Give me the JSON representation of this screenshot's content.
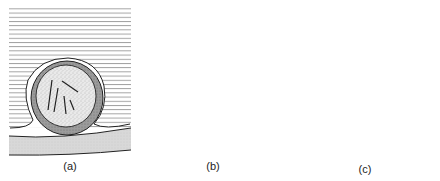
{
  "figure": {
    "panels": [
      {
        "id": "a",
        "label": "(a)",
        "description": "Particle enclosed by encapsulating film on substrate"
      },
      {
        "id": "b",
        "label": "(b)",
        "description": "Particle and substrate surrounded by adsorbed surfactant molecules"
      },
      {
        "id": "c",
        "label": "(c)",
        "description": "Porous solid with surfactant-lined crevices"
      }
    ]
  },
  "colors": {
    "line": "#222222",
    "stipple": "#9a9a9a",
    "substrate": "#d6d6d6",
    "background": "#ffffff"
  }
}
